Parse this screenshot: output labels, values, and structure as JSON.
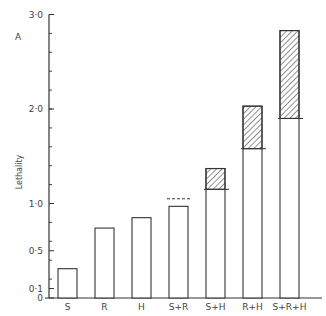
{
  "chart_data": {
    "type": "bar",
    "title": "",
    "xlabel": "",
    "ylabel": "Lethality",
    "annotation": "A",
    "ylim": [
      0,
      3.0
    ],
    "yticks": [
      {
        "value": 0,
        "label": "0"
      },
      {
        "value": 0.1,
        "label": "0·1"
      },
      {
        "value": 0.5,
        "label": "0·5"
      },
      {
        "value": 1.0,
        "label": "1·0"
      },
      {
        "value": 2.0,
        "label": "2·0"
      },
      {
        "value": 3.0,
        "label": "3·0"
      }
    ],
    "minor_tick_step": 0.2,
    "grid": false,
    "categories": [
      "S",
      "R",
      "H",
      "S+R",
      "S+H",
      "R+H",
      "S+R+H"
    ],
    "series": [
      {
        "name": "Observed lethality",
        "values": [
          0.31,
          0.74,
          0.85,
          0.97,
          1.37,
          2.03,
          2.83
        ]
      },
      {
        "name": "Expected additive (line)",
        "values": [
          null,
          null,
          null,
          1.05,
          1.15,
          1.58,
          1.9
        ]
      }
    ],
    "expected_line_style": [
      "",
      "",
      "",
      "dashed",
      "solid",
      "solid",
      "solid"
    ],
    "hatched_excess": "hatched region between expected line and bar top indicates synergism"
  }
}
